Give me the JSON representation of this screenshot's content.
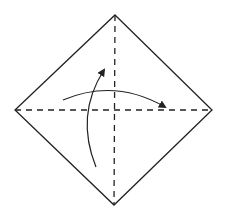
{
  "diagram": {
    "stroke_color": "#222222",
    "background": "#ffffff",
    "square": {
      "top": [
        115,
        15
      ],
      "right": [
        212,
        110
      ],
      "bottom": [
        114,
        205
      ],
      "left": [
        15,
        110
      ]
    },
    "folds": [
      {
        "type": "valley",
        "style": "dashed",
        "from": [
          115,
          15
        ],
        "to": [
          114,
          205
        ]
      },
      {
        "type": "valley",
        "style": "dashed",
        "from": [
          15,
          110
        ],
        "to": [
          212,
          110
        ]
      }
    ],
    "arrows": [
      {
        "name": "fold-left-to-right",
        "path": "M63 100 Q115 78 165 107"
      },
      {
        "name": "fold-bottom-to-top",
        "path": "M96 167 Q75 115 104 70"
      }
    ]
  }
}
